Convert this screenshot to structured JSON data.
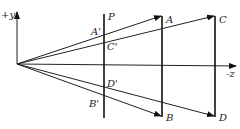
{
  "diagram": {
    "axes": {
      "y_label": "+y",
      "z_label": "-z"
    },
    "plane_label": "P",
    "points": {
      "A": "A",
      "B": "B",
      "C": "C",
      "D": "D",
      "A_proj": "A'",
      "B_proj": "B'",
      "C_proj": "C'",
      "D_proj": "D'"
    },
    "colors": {
      "line": "#222222",
      "background": "#ffffff"
    }
  }
}
